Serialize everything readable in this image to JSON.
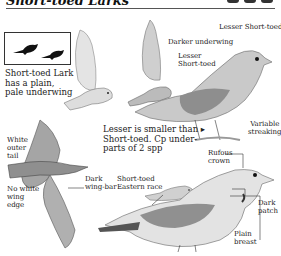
{
  "header": {
    "title": "Short-toed Larks",
    "icons": [
      "habitat-icon",
      "habitat-icon",
      "habitat-icon"
    ]
  },
  "silhouette_box": {
    "icons": [
      "bird-silhouette-icon",
      "bird-silhouette-icon"
    ]
  },
  "labels": {
    "short_toed_caption": "Short-toed Lark\nhas a plain,\npale underwing",
    "short_toed_l1": "Short-toed Lark",
    "short_toed_l2": "has a plain,",
    "short_toed_l3": "pale underwing",
    "lesser_short_toed_top": "Lesser Short-toed",
    "darker_underwing": "Darker underwing",
    "lesser_l1": "Lesser",
    "lesser_l2": "Short-toed",
    "variable_l1": "Variable",
    "variable_l2": "streaking",
    "white_l1": "White",
    "white_l2": "outer",
    "white_l3": "tail",
    "no_white_l1": "No white",
    "no_white_l2": "wing",
    "no_white_l3": "edge",
    "note_l1": "Lesser is smaller than ▸",
    "note_l2": "Short-toed. Cp under-",
    "note_l3": "parts of 2 spp",
    "dark_wingbar_l1": "Dark",
    "dark_wingbar_l2": "wing-bar",
    "eastern_l1": "Short-toed",
    "eastern_l2": "Eastern race",
    "rufous_l1": "Rufous",
    "rufous_l2": "crown",
    "dark_patch_l1": "Dark",
    "dark_patch_l2": "patch",
    "plain_l1": "Plain",
    "plain_l2": "breast"
  },
  "colors": {
    "ink": "#222222",
    "bird_light": "#d9d9d9",
    "bird_mid": "#9a9a9a",
    "bird_dark": "#555555"
  }
}
